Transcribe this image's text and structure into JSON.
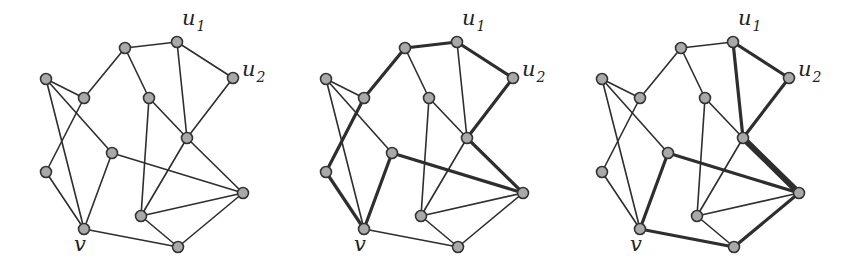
{
  "figure": {
    "panels": 3,
    "panel_offsets": [
      0,
      280,
      556
    ],
    "colors": {
      "edge": "#2e2e2e",
      "node_fill": "#a9a9a9",
      "node_stroke": "#333333",
      "background": "#ffffff"
    },
    "edge_width": {
      "normal": 1.6,
      "bold": 3.2,
      "double": 6
    },
    "node_radius": 5.5
  },
  "graph": {
    "nodes": {
      "A": {
        "x": 125,
        "y": 48
      },
      "u1": {
        "x": 177,
        "y": 42,
        "label": "u",
        "sub": "1"
      },
      "u2": {
        "x": 233,
        "y": 78,
        "label": "u",
        "sub": "2"
      },
      "B": {
        "x": 46,
        "y": 79
      },
      "C": {
        "x": 84,
        "y": 98
      },
      "D": {
        "x": 149,
        "y": 98
      },
      "E": {
        "x": 187,
        "y": 138
      },
      "F": {
        "x": 112,
        "y": 153
      },
      "G": {
        "x": 46,
        "y": 172
      },
      "H": {
        "x": 243,
        "y": 193
      },
      "I": {
        "x": 141,
        "y": 216
      },
      "v": {
        "x": 84,
        "y": 229,
        "label": "v"
      },
      "J": {
        "x": 178,
        "y": 247
      }
    },
    "edges": [
      [
        "A",
        "u1"
      ],
      [
        "A",
        "C"
      ],
      [
        "A",
        "D"
      ],
      [
        "u1",
        "u2"
      ],
      [
        "u1",
        "E"
      ],
      [
        "u2",
        "E"
      ],
      [
        "B",
        "C"
      ],
      [
        "B",
        "F"
      ],
      [
        "B",
        "v"
      ],
      [
        "C",
        "G"
      ],
      [
        "D",
        "E"
      ],
      [
        "D",
        "I"
      ],
      [
        "E",
        "I"
      ],
      [
        "E",
        "H"
      ],
      [
        "F",
        "v"
      ],
      [
        "F",
        "H"
      ],
      [
        "G",
        "v"
      ],
      [
        "I",
        "H"
      ],
      [
        "I",
        "J"
      ],
      [
        "v",
        "J"
      ],
      [
        "J",
        "H"
      ]
    ]
  },
  "panels": [
    {
      "name": "graph-plain",
      "bold": [],
      "double": []
    },
    {
      "name": "graph-cycle-highlight",
      "bold": [
        [
          "v",
          "G"
        ],
        [
          "G",
          "C"
        ],
        [
          "C",
          "A"
        ],
        [
          "A",
          "u1"
        ],
        [
          "u1",
          "u2"
        ],
        [
          "u2",
          "E"
        ],
        [
          "E",
          "H"
        ],
        [
          "H",
          "F"
        ],
        [
          "F",
          "v"
        ]
      ],
      "double": []
    },
    {
      "name": "graph-paths-highlight",
      "bold": [
        [
          "u1",
          "u2"
        ],
        [
          "u2",
          "E"
        ],
        [
          "u1",
          "E"
        ],
        [
          "F",
          "H"
        ],
        [
          "F",
          "v"
        ],
        [
          "v",
          "J"
        ],
        [
          "J",
          "H"
        ]
      ],
      "double": [
        [
          "E",
          "H"
        ]
      ]
    }
  ],
  "labels": {
    "u1": {
      "text": "u",
      "sub": "1",
      "dx": 5,
      "dy": -17
    },
    "u2": {
      "text": "u",
      "sub": "2",
      "dx": 9,
      "dy": -2
    },
    "v": {
      "text": "v",
      "dx": -10,
      "dy": 22
    }
  }
}
